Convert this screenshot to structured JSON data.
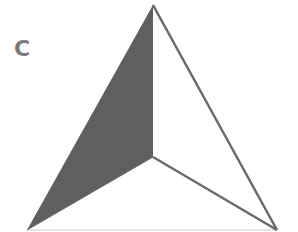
{
  "figure": {
    "panel_label": "C",
    "colors": {
      "shaded_face": "#5f5f5f",
      "edge": "#6a6a6a",
      "base_edge": "#dcdcdc",
      "label": "#7a7a7a"
    },
    "vertices": {
      "apex": [
        153,
        5
      ],
      "center": [
        153,
        157
      ],
      "bottom_left": [
        27,
        230
      ],
      "bottom_right": [
        277,
        230
      ]
    }
  }
}
